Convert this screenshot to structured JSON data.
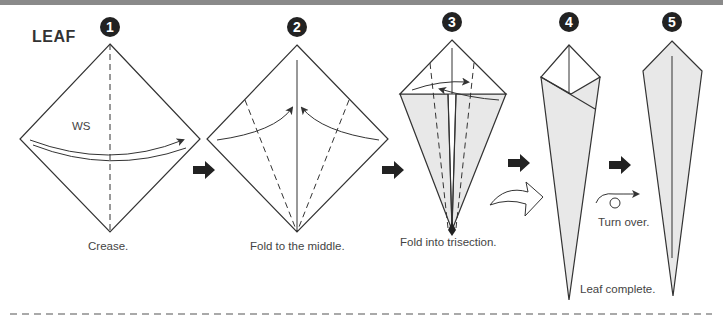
{
  "title": "LEAF",
  "steps": [
    {
      "number": "1",
      "caption": "Crease.",
      "annotation": "WS"
    },
    {
      "number": "2",
      "caption": "Fold to the middle."
    },
    {
      "number": "3",
      "caption": "Fold into trisection."
    },
    {
      "number": "4",
      "caption": ""
    },
    {
      "number": "5",
      "caption": "Leaf complete.",
      "instruction": "Turn over."
    }
  ],
  "colors": {
    "line": "#333333",
    "shade": "#e8e8e8",
    "arrow": "#333333",
    "topbar": "#8a8a8a"
  }
}
